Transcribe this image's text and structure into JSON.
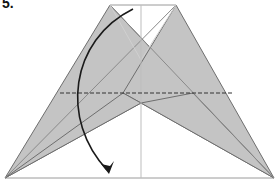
{
  "diagram": {
    "step_label": "5.",
    "type": "origami-fold-instruction",
    "colors": {
      "paper_fill": "#c4c4c4",
      "edge": "#6e6e6e",
      "crease": "#9a9a9a",
      "thin_line": "#bdbdbd",
      "dashed_valley_fold": "#333333",
      "arrow": "#1a1a1a",
      "background": "#ffffff"
    },
    "elements": [
      "left gray flap",
      "right gray flap",
      "valley fold dashed line",
      "curved fold arrow pointing down",
      "center vertical reference line",
      "baseline"
    ]
  }
}
